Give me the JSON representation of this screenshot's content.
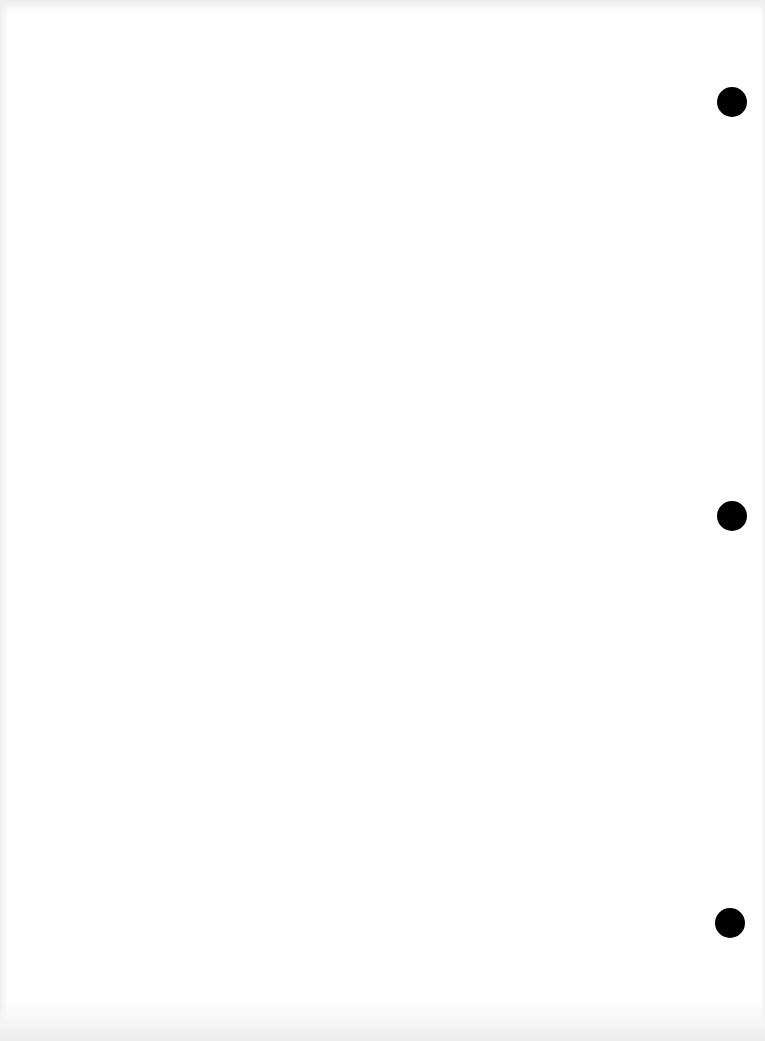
{
  "page": {
    "width": 765,
    "height": 1041,
    "background": "#ffffff",
    "content": "blank scanned page"
  },
  "punch_holes": [
    {
      "cx": 732,
      "cy": 102,
      "r": 15,
      "color": "#000000"
    },
    {
      "cx": 732,
      "cy": 516,
      "r": 15,
      "color": "#000000"
    },
    {
      "cx": 730,
      "cy": 923,
      "r": 15,
      "color": "#000000"
    }
  ]
}
